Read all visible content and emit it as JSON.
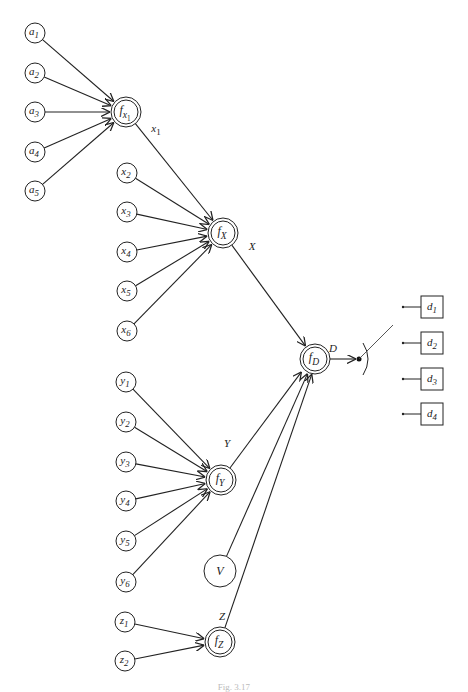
{
  "figure": {
    "caption": "Fig. 3.17"
  },
  "nodes": {
    "a": [
      {
        "id": "a1",
        "base": "a",
        "sub": "1",
        "cx": 35,
        "cy": 33
      },
      {
        "id": "a2",
        "base": "a",
        "sub": "2",
        "cx": 35,
        "cy": 73
      },
      {
        "id": "a3",
        "base": "a",
        "sub": "3",
        "cx": 35,
        "cy": 112
      },
      {
        "id": "a4",
        "base": "a",
        "sub": "4",
        "cx": 35,
        "cy": 152
      },
      {
        "id": "a5",
        "base": "a",
        "sub": "5",
        "cx": 35,
        "cy": 191
      }
    ],
    "x": [
      {
        "id": "x2",
        "base": "x",
        "sub": "2",
        "cx": 127,
        "cy": 173
      },
      {
        "id": "x3",
        "base": "x",
        "sub": "3",
        "cx": 127,
        "cy": 212
      },
      {
        "id": "x4",
        "base": "x",
        "sub": "4",
        "cx": 127,
        "cy": 252
      },
      {
        "id": "x5",
        "base": "x",
        "sub": "5",
        "cx": 127,
        "cy": 291
      },
      {
        "id": "x6",
        "base": "x",
        "sub": "6",
        "cx": 127,
        "cy": 331
      }
    ],
    "y": [
      {
        "id": "y1",
        "base": "y",
        "sub": "1",
        "cx": 126,
        "cy": 382
      },
      {
        "id": "y2",
        "base": "y",
        "sub": "2",
        "cx": 126,
        "cy": 422
      },
      {
        "id": "y3",
        "base": "y",
        "sub": "3",
        "cx": 126,
        "cy": 462
      },
      {
        "id": "y4",
        "base": "y",
        "sub": "4",
        "cx": 126,
        "cy": 501
      },
      {
        "id": "y5",
        "base": "y",
        "sub": "5",
        "cx": 126,
        "cy": 541
      },
      {
        "id": "y6",
        "base": "y",
        "sub": "6",
        "cx": 126,
        "cy": 582
      }
    ],
    "z": [
      {
        "id": "z1",
        "base": "z",
        "sub": "1",
        "cx": 125,
        "cy": 622
      },
      {
        "id": "z2",
        "base": "z",
        "sub": "2",
        "cx": 125,
        "cy": 661
      }
    ],
    "functions": [
      {
        "id": "fx1",
        "base": "f",
        "sub": "x",
        "subsub": "1",
        "cx": 126,
        "cy": 112,
        "output_label": "x",
        "output_sub": "1",
        "label_x": 156,
        "label_y": 132
      },
      {
        "id": "fX",
        "base": "f",
        "sub": "X",
        "cx": 223,
        "cy": 233,
        "output_label": "X",
        "output_sub": "",
        "label_x": 252,
        "label_y": 250
      },
      {
        "id": "fY",
        "base": "f",
        "sub": "Y",
        "cx": 221,
        "cy": 480,
        "output_label": "Y",
        "output_sub": "",
        "label_x": 227,
        "label_y": 447
      },
      {
        "id": "fZ",
        "base": "f",
        "sub": "Z",
        "cx": 220,
        "cy": 642,
        "output_label": "Z",
        "output_sub": "",
        "label_x": 222,
        "label_y": 620
      },
      {
        "id": "fD",
        "base": "f",
        "sub": "D",
        "cx": 315,
        "cy": 359,
        "output_label": "D",
        "output_sub": "",
        "label_x": 333,
        "label_y": 352
      }
    ],
    "V": {
      "id": "V",
      "label": "V",
      "cx": 220,
      "cy": 571,
      "r": 16
    },
    "decisions": [
      {
        "id": "d1",
        "base": "d",
        "sub": "1",
        "cy": 307
      },
      {
        "id": "d2",
        "base": "d",
        "sub": "2",
        "cy": 343
      },
      {
        "id": "d3",
        "base": "d",
        "sub": "3",
        "cy": 379
      },
      {
        "id": "d4",
        "base": "d",
        "sub": "4",
        "cy": 414
      }
    ]
  },
  "switch": {
    "dot_x": 359,
    "dot_y": 359,
    "arm_end_x": 393,
    "arm_end_y": 325
  }
}
